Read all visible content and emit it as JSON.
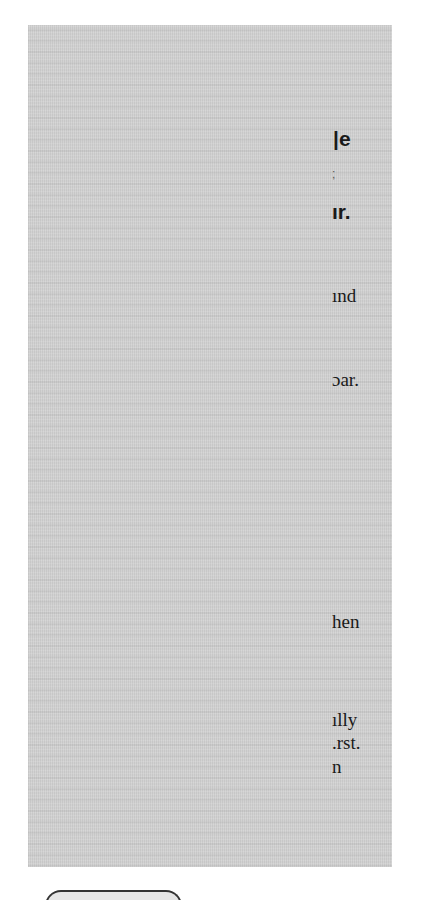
{
  "document": {
    "panel_background": "#d2d2d2",
    "text_color": "#1a1a1a",
    "heading_fragments": [
      {
        "text": "|e",
        "top": 128,
        "left": 333
      },
      {
        "text": ";",
        "top": 168,
        "left": 332
      },
      {
        "text": "ır.",
        "top": 201,
        "left": 332
      }
    ],
    "body_fragments": [
      {
        "text": "ınd",
        "top": 286,
        "left": 332
      },
      {
        "text": "ɔar.",
        "top": 370,
        "left": 332
      },
      {
        "text": "hen",
        "top": 612,
        "left": 332
      },
      {
        "text": "ılly",
        "top": 710,
        "left": 332
      },
      {
        "text": ".rst.",
        "top": 733,
        "left": 332
      },
      {
        "text": "n",
        "top": 757,
        "left": 332
      }
    ]
  },
  "bottom_button": {
    "label": ""
  }
}
